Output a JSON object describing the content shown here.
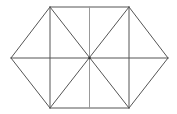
{
  "figure": {
    "background": "#ffffff",
    "stroke_color": "#555555",
    "center_line_color": "#999999",
    "vertices": {
      "top_left": [
        50,
        7
      ],
      "top_right": [
        129,
        7
      ],
      "right": [
        168,
        58
      ],
      "bottom_right": [
        129,
        108
      ],
      "bottom_left": [
        50,
        108
      ],
      "left": [
        11,
        58
      ],
      "center": [
        89.5,
        58
      ],
      "top_mid": [
        89.5,
        7
      ],
      "bottom_mid": [
        89.5,
        108
      ]
    }
  }
}
